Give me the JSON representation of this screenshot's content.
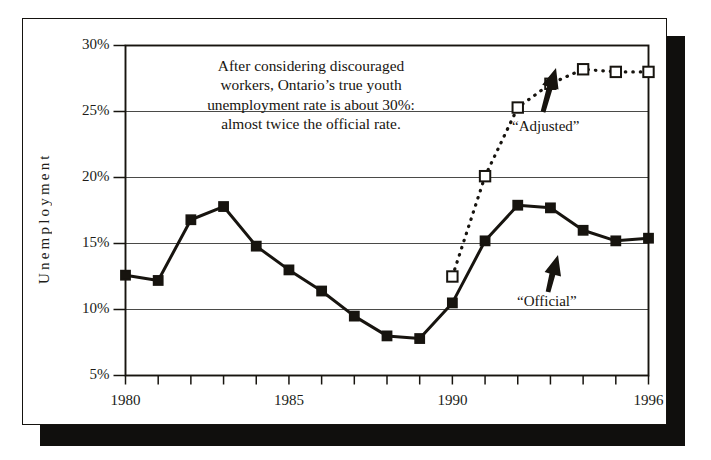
{
  "figure": {
    "annotation_lines": [
      "After considering discouraged",
      "workers, Ontario’s true youth",
      "unemployment rate is about 30%:",
      "almost twice the official rate."
    ],
    "series_labels": {
      "adjusted": "“Adjusted”",
      "official": "“Official”"
    },
    "colors": {
      "ink": "#17140f",
      "grid": "#4a4a48",
      "card_border": "#15130f",
      "shadow": "#100f0d",
      "paper": "#ffffff"
    }
  },
  "chart_data": {
    "type": "line",
    "title": "",
    "subtitle": "",
    "xlabel": "",
    "ylabel": "Unemployment",
    "xlim": [
      1980,
      1996
    ],
    "ylim": [
      5,
      30
    ],
    "y_tick_labels": [
      "30%",
      "25%",
      "20%",
      "15%",
      "10%",
      "5%"
    ],
    "y_ticks": [
      30,
      25,
      20,
      15,
      10,
      5
    ],
    "x_ticks": [
      1980,
      1981,
      1982,
      1983,
      1984,
      1985,
      1986,
      1987,
      1988,
      1989,
      1990,
      1991,
      1992,
      1993,
      1994,
      1995,
      1996
    ],
    "x_tick_labels": [
      {
        "value": 1980,
        "label": "1980"
      },
      {
        "value": 1985,
        "label": "1985"
      },
      {
        "value": 1990,
        "label": "1990"
      },
      {
        "value": 1996,
        "label": "1996"
      }
    ],
    "grid": "horizontal",
    "gridlines": [
      25,
      20,
      15,
      10
    ],
    "legend": "annotated-arrows",
    "series": [
      {
        "name": "“Official”",
        "style": "solid",
        "marker": "filled-square",
        "x": [
          1980,
          1981,
          1982,
          1983,
          1984,
          1985,
          1986,
          1987,
          1988,
          1989,
          1990,
          1991,
          1992,
          1993,
          1994,
          1995,
          1996
        ],
        "values": [
          12.6,
          12.2,
          16.8,
          17.8,
          14.8,
          13.0,
          11.4,
          9.5,
          8.0,
          7.8,
          10.5,
          15.2,
          17.9,
          17.7,
          16.0,
          15.2,
          15.4
        ]
      },
      {
        "name": "“Adjusted”",
        "style": "dotted",
        "marker": "open-square",
        "x": [
          1990,
          1991,
          1992,
          1993,
          1994,
          1995,
          1996
        ],
        "values": [
          12.5,
          20.1,
          25.3,
          27.1,
          28.2,
          28.0,
          28.0
        ]
      }
    ],
    "annotations": [
      {
        "text": "After considering discouraged workers, Ontario’s true youth unemployment rate is about 30%: almost twice the official rate.",
        "x": 1982.8,
        "y": 26.0
      },
      {
        "text": "“Adjusted”",
        "x": 1993.1,
        "y": 23.0,
        "arrow": "up-left-to-dotted"
      },
      {
        "text": "“Official”",
        "x": 1993.2,
        "y": 10.3,
        "arrow": "up-left-to-solid"
      }
    ]
  }
}
